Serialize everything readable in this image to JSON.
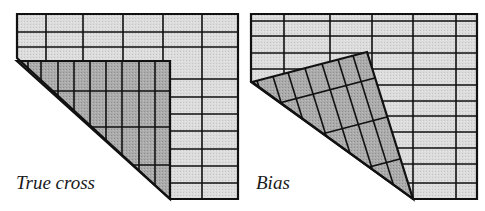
{
  "figure": {
    "panels": [
      {
        "id": "true-cross",
        "label": "True cross",
        "outer": {
          "x1": 17,
          "y1": 14,
          "x2": 238,
          "y2": 199
        },
        "cut_corner": {
          "top": [
            17,
            58
          ],
          "bottom": [
            170,
            199
          ]
        },
        "columns_x": [
          46,
          83,
          123,
          163,
          202
        ],
        "rows_y_top": [
          32,
          47
        ],
        "rows_y_right": [
          79,
          97,
          114,
          131,
          149,
          166,
          183
        ],
        "fold": {
          "polygon": [
            [
              17,
              61
            ],
            [
              170,
              61
            ],
            [
              170,
              199
            ]
          ],
          "vertical_lines_x": [
            28,
            41,
            58,
            74,
            90,
            106,
            122,
            139,
            155
          ],
          "horizontal_lines_y": [
            91,
            127,
            165
          ]
        }
      },
      {
        "id": "bias",
        "label": "Bias",
        "outer": {
          "x1": 251,
          "y1": 14,
          "x2": 477,
          "y2": 199
        },
        "cut_corner": {
          "top": [
            251,
            82
          ],
          "bottom": [
            413,
            199
          ]
        },
        "columns_x": [
          284,
          330,
          372,
          413,
          456
        ],
        "rows_y": [
          21,
          36,
          53,
          69,
          85,
          101,
          116,
          132,
          148,
          164,
          183
        ],
        "fold": {
          "polygon": [
            [
              252,
              82
            ],
            [
              367,
              52
            ],
            [
              413,
              199
            ]
          ],
          "top_edge_points": [
            [
              257,
              80.7
            ],
            [
              273,
              76.5
            ],
            [
              288,
              72.6
            ],
            [
              305,
              68.2
            ],
            [
              322,
              63.7
            ],
            [
              338,
              59.6
            ],
            [
              353,
              55.7
            ]
          ],
          "right_edge_points": [
            [
              375,
              78
            ],
            [
              387,
              117
            ],
            [
              400,
              159
            ]
          ]
        }
      }
    ],
    "colors": {
      "paper": "#ffffff",
      "grid_fill": "#d9d9d9",
      "fold_fill": "#a8a8a8",
      "line": "#111111"
    }
  }
}
